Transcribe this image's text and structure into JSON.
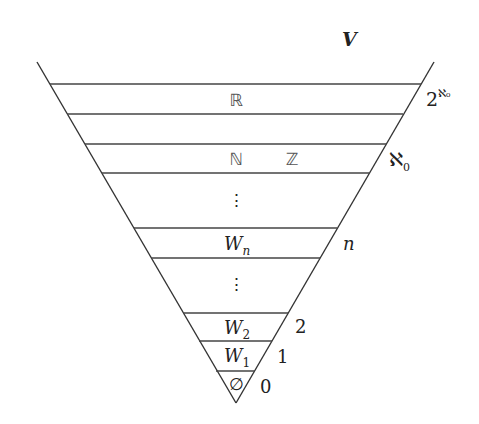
{
  "diagram": {
    "title": "V",
    "colors": {
      "line": "#333333",
      "text": "#222222",
      "background": "#ffffff"
    },
    "layers": [
      {
        "id": "top",
        "content": ""
      },
      {
        "id": "reals-layer",
        "content": "ℝ"
      },
      {
        "id": "gap-1",
        "content": ""
      },
      {
        "id": "naturals-integers-layer",
        "content_left": "ℕ",
        "content_right": "ℤ"
      },
      {
        "id": "ellipsis-upper",
        "content": "⋮"
      },
      {
        "id": "wn-layer",
        "content": "W",
        "subscript": "n"
      },
      {
        "id": "ellipsis-lower",
        "content": "⋮"
      },
      {
        "id": "w2-layer",
        "content": "W",
        "subscript": "2"
      },
      {
        "id": "w1-layer",
        "content": "W",
        "subscript": "1"
      },
      {
        "id": "empty-layer",
        "content": "∅"
      }
    ],
    "rank_labels": [
      {
        "id": "rank-2-aleph0",
        "base": "2",
        "exponent": "ℵ₀"
      },
      {
        "id": "rank-aleph0",
        "base": "ℵ",
        "subscript": "0"
      },
      {
        "id": "rank-n",
        "text": "n"
      },
      {
        "id": "rank-2",
        "text": "2"
      },
      {
        "id": "rank-1",
        "text": "1"
      },
      {
        "id": "rank-0",
        "text": "0"
      }
    ]
  }
}
